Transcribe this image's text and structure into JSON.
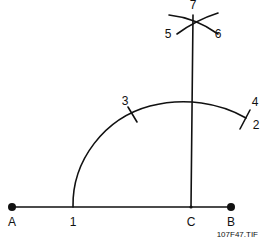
{
  "diagram": {
    "caption": "107F47.TIF",
    "colors": {
      "line": "#111111",
      "background": "#ffffff"
    },
    "points": {
      "A": "A",
      "B": "B",
      "C": "C",
      "p1": "1",
      "p2": "2",
      "p3": "3",
      "p4": "4",
      "p5": "5",
      "p6": "6",
      "p7": "7"
    }
  }
}
